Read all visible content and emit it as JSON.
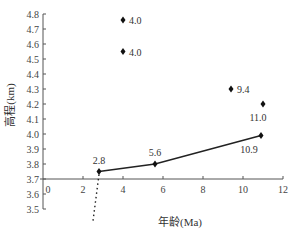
{
  "chart_data": {
    "type": "scatter",
    "title": "",
    "xlabel": "年龄(Ma)",
    "ylabel": "高程(km)",
    "xlim": [
      0,
      12
    ],
    "ylim": [
      3.5,
      4.8
    ],
    "x_ticks": [
      "0",
      "2",
      "4",
      "6",
      "8",
      "10",
      "12"
    ],
    "y_ticks": [
      "3.5",
      "3.6",
      "3.7",
      "3.8",
      "3.9",
      "4.0",
      "4.1",
      "4.2",
      "4.3",
      "4.4",
      "4.5",
      "4.6",
      "4.7",
      "4.8"
    ],
    "grid": false,
    "series": [
      {
        "name": "trend line",
        "type": "line",
        "points": [
          {
            "x": 2.8,
            "y": 3.75,
            "label": "2.8"
          },
          {
            "x": 5.6,
            "y": 3.8,
            "label": "5.6"
          },
          {
            "x": 10.9,
            "y": 3.99,
            "label": "10.9"
          }
        ]
      },
      {
        "name": "isolated points",
        "type": "scatter",
        "points": [
          {
            "x": 4.0,
            "y": 4.76,
            "label": "4.0"
          },
          {
            "x": 4.0,
            "y": 4.55,
            "label": "4.0"
          },
          {
            "x": 9.4,
            "y": 4.3,
            "label": "9.4"
          },
          {
            "x": 11.0,
            "y": 4.2,
            "label": "11.0"
          }
        ]
      },
      {
        "name": "dotted extension",
        "type": "dotted-line",
        "points": [
          {
            "x": 2.8,
            "y": 3.75
          },
          {
            "x": 2.5,
            "y": 3.42
          }
        ]
      }
    ]
  }
}
